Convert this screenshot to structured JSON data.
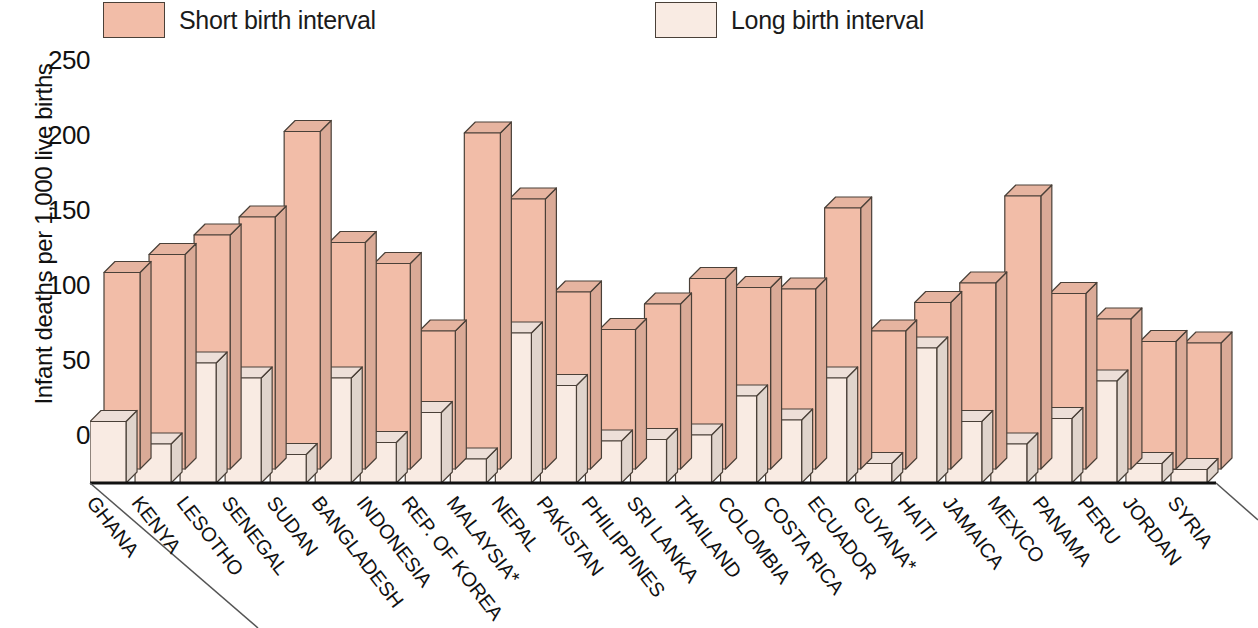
{
  "legend": {
    "short": {
      "label": "Short birth interval",
      "color": "#f2bda8"
    },
    "long": {
      "label": "Long birth interval",
      "color": "#f9ebe3"
    }
  },
  "axis": {
    "y_title": "Infant deaths per 1,000 live births",
    "y_ticks": [
      "250",
      "200",
      "150",
      "100",
      "50",
      "0"
    ]
  },
  "chart_data": {
    "type": "bar",
    "title": "",
    "subtitle": "",
    "xlabel": "",
    "ylabel": "Infant deaths per 1,000 live births",
    "ylim": [
      0,
      250
    ],
    "ytick_values": [
      0,
      50,
      100,
      150,
      200,
      250
    ],
    "grid": false,
    "legend_position": "top",
    "projection": "3d-axonometric",
    "categories": [
      "GHANA",
      "KENYA",
      "LESOTHO",
      "SENEGAL",
      "SUDAN",
      "BANGLADESH",
      "INDONESIA",
      "REP. OF KOREA",
      "MALAYSIA*",
      "NEPAL",
      "PAKISTAN",
      "PHILIPPINES",
      "SRI LANKA",
      "THAILAND",
      "COLOMBIA",
      "COSTA RICA",
      "ECUADOR",
      "GUYANA*",
      "HAITI",
      "JAMAICA",
      "MEXICO",
      "PANAMA",
      "PERU",
      "JORDAN",
      "SYRIA"
    ],
    "series": [
      {
        "name": "Short birth interval",
        "color": "#f2bda8",
        "values": [
          131,
          143,
          156,
          168,
          225,
          151,
          137,
          92,
          224,
          180,
          118,
          93,
          110,
          127,
          121,
          120,
          174,
          92,
          111,
          124,
          182,
          117,
          100,
          85,
          84
        ]
      },
      {
        "name": "Long birth interval",
        "color": "#f9ebe3",
        "values": [
          41,
          26,
          80,
          70,
          19,
          70,
          27,
          47,
          16,
          100,
          65,
          28,
          29,
          32,
          58,
          42,
          70,
          13,
          90,
          41,
          26,
          43,
          68,
          13,
          9
        ]
      }
    ],
    "footnote_marker": "*"
  }
}
